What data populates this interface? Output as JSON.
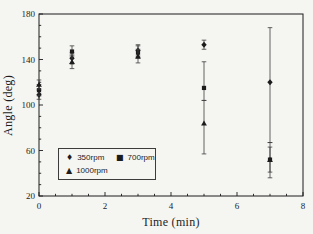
{
  "figure": {
    "background": "#f5f5f2",
    "ink": "#1c1c1c",
    "error_bar_color": "#3d3d3d"
  },
  "legend": {
    "glyphs": {
      "diamond": "♦",
      "square": "■",
      "triangle": "▲"
    }
  },
  "chart_data": {
    "type": "scatter",
    "title": "",
    "xlabel": "Time (min)",
    "ylabel": "Angle (deg)",
    "xlim": [
      0,
      8
    ],
    "ylim": [
      20,
      180
    ],
    "x_ticks": [
      0,
      2,
      4,
      6,
      8
    ],
    "y_ticks": [
      20,
      60,
      100,
      140,
      180
    ],
    "x_minor_step": 0.5,
    "y_minor_step": 10,
    "grid": false,
    "error_bars": true,
    "legend_position": "inside lower-left",
    "series": [
      {
        "name": "350rpm",
        "marker": "diamond",
        "points": [
          {
            "x": 0,
            "y": 109,
            "err_lo": 4,
            "err_hi": 4
          },
          {
            "x": 1,
            "y": 141,
            "err_lo": 5,
            "err_hi": 5
          },
          {
            "x": 3,
            "y": 148,
            "err_lo": 5,
            "err_hi": 5
          },
          {
            "x": 5,
            "y": 153,
            "err_lo": 4,
            "err_hi": 4
          },
          {
            "x": 7,
            "y": 120,
            "err_lo": 53,
            "err_hi": 48
          }
        ]
      },
      {
        "name": "700rpm",
        "marker": "square",
        "points": [
          {
            "x": 0,
            "y": 113,
            "err_lo": 5,
            "err_hi": 5
          },
          {
            "x": 1,
            "y": 147,
            "err_lo": 4,
            "err_hi": 5
          },
          {
            "x": 3,
            "y": 146,
            "err_lo": 5,
            "err_hi": 6
          },
          {
            "x": 5,
            "y": 115,
            "err_lo": 11,
            "err_hi": 23
          },
          {
            "x": 7,
            "y": 52,
            "err_lo": 11,
            "err_hi": 11
          }
        ]
      },
      {
        "name": "1000rpm",
        "marker": "triangle",
        "points": [
          {
            "x": 0,
            "y": 118,
            "err_lo": 4,
            "err_hi": 4
          },
          {
            "x": 1,
            "y": 138,
            "err_lo": 6,
            "err_hi": 6
          },
          {
            "x": 3,
            "y": 143,
            "err_lo": 6,
            "err_hi": 6
          },
          {
            "x": 5,
            "y": 84,
            "err_lo": 27,
            "err_hi": 20
          },
          {
            "x": 7,
            "y": 52,
            "err_lo": 16,
            "err_hi": 15
          }
        ]
      }
    ]
  }
}
